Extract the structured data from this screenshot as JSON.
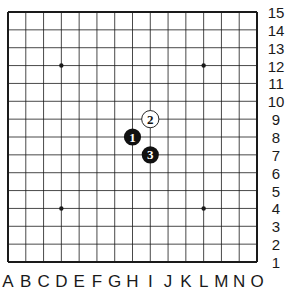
{
  "board": {
    "size": 15,
    "columns": [
      "A",
      "B",
      "C",
      "D",
      "E",
      "F",
      "G",
      "H",
      "I",
      "J",
      "K",
      "L",
      "M",
      "N",
      "O"
    ],
    "rows": [
      "15",
      "14",
      "13",
      "12",
      "11",
      "10",
      "9",
      "8",
      "7",
      "6",
      "5",
      "4",
      "3",
      "2",
      "1"
    ],
    "star_points": [
      "D12",
      "L12",
      "D4",
      "L4"
    ],
    "colors": {
      "line": "#1a1a1a",
      "background": "#ffffff",
      "black_stone": "#111111",
      "white_stone": "#ffffff"
    }
  },
  "stones": [
    {
      "move": "1",
      "color": "black",
      "point": "H8"
    },
    {
      "move": "2",
      "color": "white",
      "point": "I9"
    },
    {
      "move": "3",
      "color": "black",
      "point": "I7"
    }
  ]
}
